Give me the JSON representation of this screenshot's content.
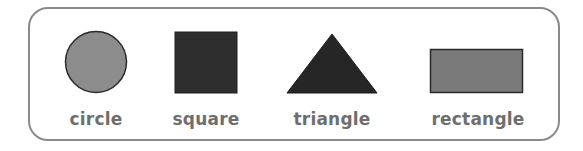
{
  "shapes": [
    {
      "name": "circle",
      "label": "circle",
      "fill": "#8c8c8c",
      "stroke": "#2b2b2b"
    },
    {
      "name": "square",
      "label": "square",
      "fill": "#2e2e2e",
      "stroke": "#1e1e1e"
    },
    {
      "name": "triangle",
      "label": "triangle",
      "fill": "#262626",
      "stroke": "#1a1a1a"
    },
    {
      "name": "rectangle",
      "label": "rectangle",
      "fill": "#7a7a7a",
      "stroke": "#2b2b2b"
    }
  ],
  "colors": {
    "frame_border": "#8a8a8a",
    "label_text": "#6e6e6e",
    "background": "#ffffff"
  }
}
